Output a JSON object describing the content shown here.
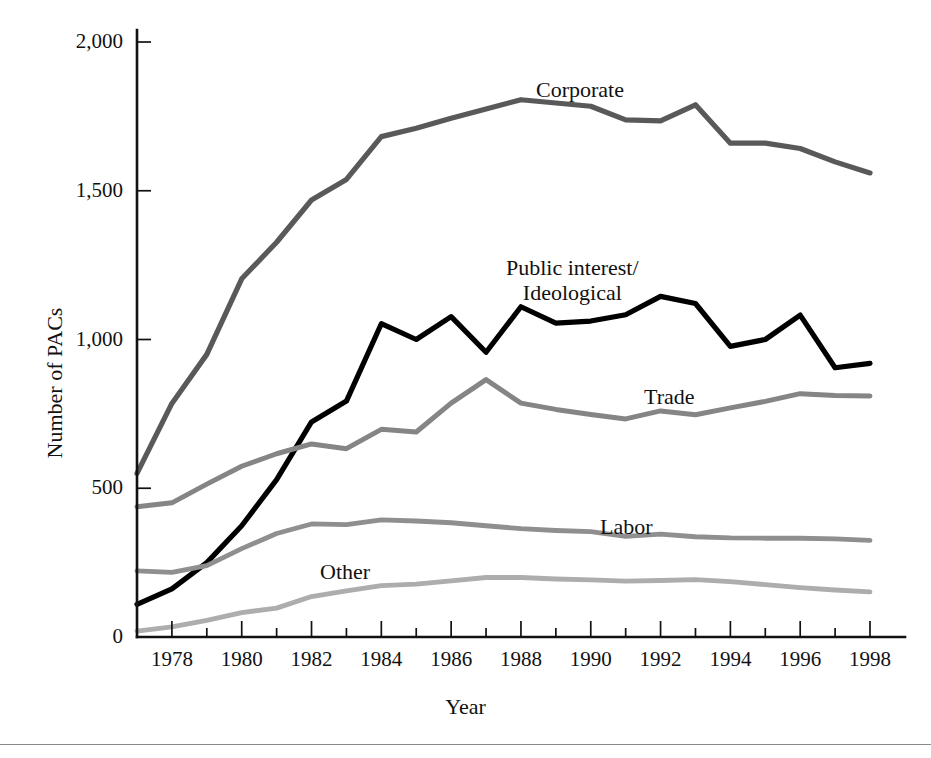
{
  "figure": {
    "background_color": "#ffffff",
    "x_axis_title": "Year",
    "y_axis_title": "Number of PACs",
    "has_bottom_rule": true
  },
  "axes": {
    "y_tick_labels": [
      "2,000",
      "1,500",
      "1,000",
      "500",
      "0"
    ],
    "y_tick_values": [
      2000,
      1500,
      1000,
      500,
      0
    ],
    "x_tick_labels": [
      "1978",
      "1980",
      "1982",
      "1984",
      "1986",
      "1988",
      "1990",
      "1992",
      "1994",
      "1996",
      "1998"
    ],
    "x_tick_values": [
      1978,
      1980,
      1982,
      1984,
      1986,
      1988,
      1990,
      1992,
      1994,
      1996,
      1998
    ]
  },
  "series_labels": {
    "corporate": "Corporate",
    "public_interest_line1": "Public interest/",
    "public_interest_line2": "Ideological",
    "trade": "Trade",
    "labor": "Labor",
    "other": "Other"
  },
  "chart_data": {
    "type": "line",
    "title": "",
    "subtitle": "",
    "xlabel": "Year",
    "ylabel": "Number of PACs",
    "xlim": [
      1977,
      1998
    ],
    "ylim": [
      0,
      2000
    ],
    "grid": false,
    "legend": "inline-annotations",
    "x": [
      1977,
      1978,
      1979,
      1980,
      1981,
      1982,
      1983,
      1984,
      1985,
      1986,
      1987,
      1988,
      1989,
      1990,
      1991,
      1992,
      1993,
      1994,
      1995,
      1996,
      1997,
      1998
    ],
    "series": [
      {
        "name": "Corporate",
        "color": "#595959",
        "stroke_width": 5.2,
        "values": [
          550,
          785,
          950,
          1204,
          1327,
          1469,
          1538,
          1682,
          1710,
          1744,
          1775,
          1806,
          1795,
          1784,
          1738,
          1735,
          1789,
          1660,
          1660,
          1642,
          1597,
          1560
        ]
      },
      {
        "name": "Public interest/Ideological",
        "color": "#000000",
        "stroke_width": 5.2,
        "values": [
          110,
          162,
          250,
          374,
          529,
          723,
          793,
          1053,
          1000,
          1077,
          957,
          1110,
          1055,
          1062,
          1083,
          1145,
          1121,
          977,
          1000,
          1082,
          905,
          920
        ]
      },
      {
        "name": "Trade",
        "color": "#858585",
        "stroke_width": 5.0,
        "values": [
          438,
          451,
          514,
          574,
          616,
          649,
          633,
          698,
          689,
          786,
          865,
          786,
          765,
          748,
          733,
          760,
          747,
          770,
          792,
          818,
          812,
          810
        ]
      },
      {
        "name": "Labor",
        "color": "#8f8f8f",
        "stroke_width": 4.8,
        "values": [
          222,
          217,
          240,
          297,
          348,
          380,
          378,
          394,
          390,
          384,
          374,
          364,
          358,
          354,
          338,
          346,
          337,
          333,
          332,
          332,
          330,
          325
        ]
      },
      {
        "name": "Other",
        "color": "#adadad",
        "stroke_width": 4.8,
        "values": [
          20,
          34,
          56,
          82,
          97,
          136,
          155,
          173,
          178,
          189,
          200,
          200,
          195,
          192,
          188,
          190,
          193,
          186,
          176,
          166,
          158,
          152
        ]
      }
    ]
  }
}
